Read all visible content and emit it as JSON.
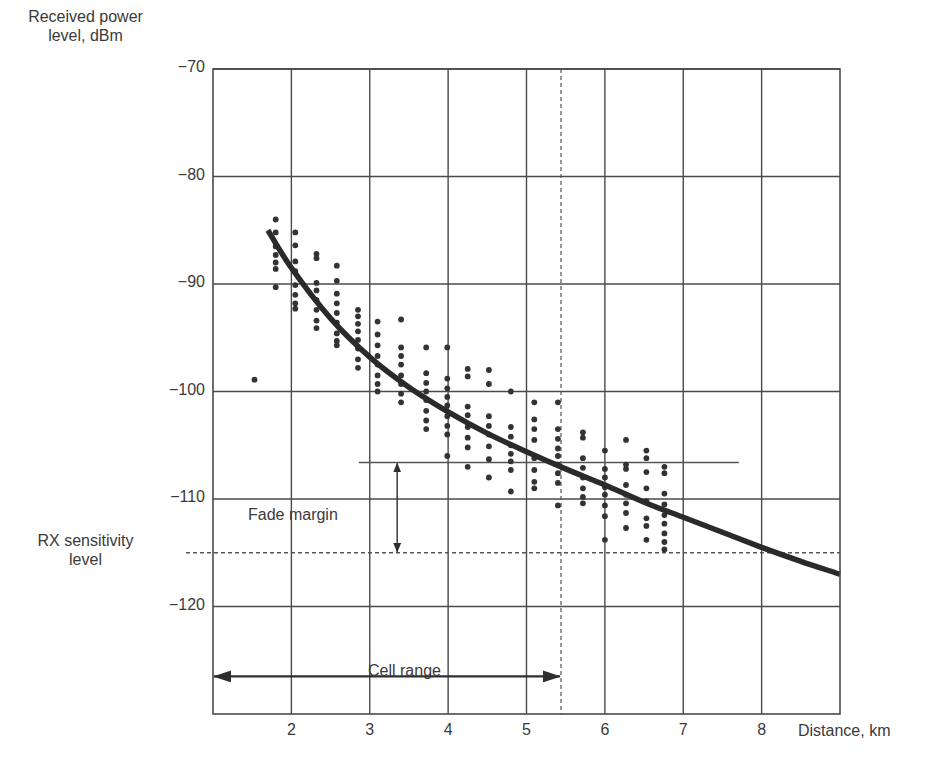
{
  "chart_data": {
    "type": "scatter",
    "title": "",
    "xlabel": "Distance, km",
    "ylabel": "Received power level, dBm",
    "xlim": [
      1,
      9
    ],
    "ylim": [
      -130,
      -70
    ],
    "grid": true,
    "x_ticks": [
      2,
      3,
      4,
      5,
      6,
      7,
      8
    ],
    "y_ticks": [
      -70,
      -80,
      -90,
      -100,
      -110,
      -120
    ],
    "y_tick_labels": [
      "−70",
      "−80",
      "−90",
      "−100",
      "−110",
      "−120"
    ],
    "x_tick_labels": [
      "2",
      "3",
      "4",
      "5",
      "6",
      "7",
      "8"
    ],
    "series": [
      {
        "name": "Measured samples",
        "kind": "scatter",
        "points": [
          [
            1.53,
            -98.9
          ],
          [
            1.8,
            -84.0
          ],
          [
            1.8,
            -85.2
          ],
          [
            1.8,
            -86.5
          ],
          [
            1.8,
            -87.3
          ],
          [
            1.8,
            -88.0
          ],
          [
            1.8,
            -88.6
          ],
          [
            1.8,
            -90.3
          ],
          [
            2.05,
            -85.2
          ],
          [
            2.05,
            -86.4
          ],
          [
            2.05,
            -87.9
          ],
          [
            2.05,
            -88.8
          ],
          [
            2.05,
            -90.1
          ],
          [
            2.05,
            -91.0
          ],
          [
            2.05,
            -91.8
          ],
          [
            2.05,
            -92.3
          ],
          [
            2.32,
            -87.2
          ],
          [
            2.32,
            -87.6
          ],
          [
            2.32,
            -89.9
          ],
          [
            2.32,
            -90.6
          ],
          [
            2.32,
            -91.5
          ],
          [
            2.32,
            -92.4
          ],
          [
            2.32,
            -93.4
          ],
          [
            2.32,
            -94.1
          ],
          [
            2.58,
            -88.3
          ],
          [
            2.58,
            -89.7
          ],
          [
            2.58,
            -90.9
          ],
          [
            2.58,
            -91.8
          ],
          [
            2.58,
            -92.7
          ],
          [
            2.58,
            -93.6
          ],
          [
            2.58,
            -94.6
          ],
          [
            2.58,
            -95.3
          ],
          [
            2.58,
            -95.7
          ],
          [
            2.85,
            -92.4
          ],
          [
            2.85,
            -93.0
          ],
          [
            2.85,
            -93.7
          ],
          [
            2.85,
            -94.4
          ],
          [
            2.85,
            -95.2
          ],
          [
            2.85,
            -96.0
          ],
          [
            2.85,
            -97.0
          ],
          [
            2.85,
            -97.8
          ],
          [
            3.1,
            -93.5
          ],
          [
            3.1,
            -94.7
          ],
          [
            3.1,
            -95.7
          ],
          [
            3.1,
            -96.7
          ],
          [
            3.1,
            -97.5
          ],
          [
            3.1,
            -98.5
          ],
          [
            3.1,
            -99.3
          ],
          [
            3.1,
            -100.0
          ],
          [
            3.4,
            -93.3
          ],
          [
            3.4,
            -95.9
          ],
          [
            3.4,
            -96.7
          ],
          [
            3.4,
            -97.5
          ],
          [
            3.4,
            -98.5
          ],
          [
            3.4,
            -99.3
          ],
          [
            3.4,
            -100.2
          ],
          [
            3.4,
            -101.0
          ],
          [
            3.72,
            -95.9
          ],
          [
            3.72,
            -98.3
          ],
          [
            3.72,
            -99.2
          ],
          [
            3.72,
            -100.0
          ],
          [
            3.72,
            -100.8
          ],
          [
            3.72,
            -101.8
          ],
          [
            3.72,
            -102.7
          ],
          [
            3.72,
            -103.5
          ],
          [
            3.99,
            -95.9
          ],
          [
            3.99,
            -98.8
          ],
          [
            3.99,
            -99.7
          ],
          [
            3.99,
            -100.5
          ],
          [
            3.99,
            -101.3
          ],
          [
            3.99,
            -102.3
          ],
          [
            3.99,
            -103.2
          ],
          [
            3.99,
            -104.0
          ],
          [
            3.99,
            -106.0
          ],
          [
            4.25,
            -97.9
          ],
          [
            4.25,
            -98.6
          ],
          [
            4.25,
            -101.4
          ],
          [
            4.25,
            -102.2
          ],
          [
            4.25,
            -103.3
          ],
          [
            4.25,
            -104.3
          ],
          [
            4.25,
            -105.2
          ],
          [
            4.25,
            -107.0
          ],
          [
            4.52,
            -98.0
          ],
          [
            4.52,
            -99.3
          ],
          [
            4.52,
            -102.3
          ],
          [
            4.52,
            -103.2
          ],
          [
            4.52,
            -104.0
          ],
          [
            4.52,
            -105.1
          ],
          [
            4.52,
            -106.3
          ],
          [
            4.52,
            -108.0
          ],
          [
            4.8,
            -100.0
          ],
          [
            4.8,
            -103.3
          ],
          [
            4.8,
            -104.2
          ],
          [
            4.8,
            -105.0
          ],
          [
            4.8,
            -105.8
          ],
          [
            4.8,
            -106.5
          ],
          [
            4.8,
            -107.3
          ],
          [
            4.8,
            -109.3
          ],
          [
            5.1,
            -101.0
          ],
          [
            5.1,
            -102.6
          ],
          [
            5.1,
            -103.5
          ],
          [
            5.1,
            -104.5
          ],
          [
            5.1,
            -106.2
          ],
          [
            5.1,
            -107.3
          ],
          [
            5.1,
            -108.4
          ],
          [
            5.1,
            -109.0
          ],
          [
            5.4,
            -101.0
          ],
          [
            5.4,
            -103.5
          ],
          [
            5.4,
            -104.4
          ],
          [
            5.4,
            -105.3
          ],
          [
            5.4,
            -106.0
          ],
          [
            5.4,
            -106.8
          ],
          [
            5.4,
            -107.6
          ],
          [
            5.4,
            -108.5
          ],
          [
            5.4,
            -110.6
          ],
          [
            5.72,
            -103.8
          ],
          [
            5.72,
            -104.3
          ],
          [
            5.72,
            -106.2
          ],
          [
            5.72,
            -107.1
          ],
          [
            5.72,
            -108.0
          ],
          [
            5.72,
            -109.0
          ],
          [
            5.72,
            -109.8
          ],
          [
            5.72,
            -110.4
          ],
          [
            6.0,
            -105.5
          ],
          [
            6.0,
            -107.2
          ],
          [
            6.0,
            -108.0
          ],
          [
            6.0,
            -108.9
          ],
          [
            6.0,
            -109.6
          ],
          [
            6.0,
            -110.6
          ],
          [
            6.0,
            -111.6
          ],
          [
            6.0,
            -113.8
          ],
          [
            6.27,
            -104.5
          ],
          [
            6.27,
            -106.8
          ],
          [
            6.27,
            -107.2
          ],
          [
            6.27,
            -108.7
          ],
          [
            6.27,
            -109.6
          ],
          [
            6.27,
            -110.4
          ],
          [
            6.27,
            -111.3
          ],
          [
            6.27,
            -112.7
          ],
          [
            6.53,
            -105.5
          ],
          [
            6.53,
            -106.2
          ],
          [
            6.53,
            -107.5
          ],
          [
            6.53,
            -109.0
          ],
          [
            6.53,
            -110.2
          ],
          [
            6.53,
            -111.8
          ],
          [
            6.53,
            -112.5
          ],
          [
            6.53,
            -113.8
          ],
          [
            6.76,
            -107.0
          ],
          [
            6.76,
            -107.6
          ],
          [
            6.76,
            -109.5
          ],
          [
            6.76,
            -110.5
          ],
          [
            6.76,
            -111.5
          ],
          [
            6.76,
            -112.3
          ],
          [
            6.76,
            -113.2
          ],
          [
            6.76,
            -114.0
          ],
          [
            6.76,
            -114.7
          ]
        ]
      },
      {
        "name": "Path loss model",
        "kind": "line",
        "points": [
          [
            1.7,
            -85.0
          ],
          [
            2.0,
            -88.5
          ],
          [
            2.5,
            -93.2
          ],
          [
            3.0,
            -96.8
          ],
          [
            3.5,
            -99.6
          ],
          [
            4.0,
            -101.9
          ],
          [
            4.5,
            -103.9
          ],
          [
            5.0,
            -105.6
          ],
          [
            5.5,
            -107.2
          ],
          [
            6.0,
            -108.7
          ],
          [
            6.5,
            -110.3
          ],
          [
            7.0,
            -111.7
          ],
          [
            7.5,
            -113.1
          ],
          [
            8.0,
            -114.5
          ],
          [
            8.5,
            -115.8
          ],
          [
            9.0,
            -117.0
          ]
        ]
      }
    ],
    "annotations": {
      "rx_sensitivity": {
        "label_line1": "RX sensitivity",
        "label_line2": "level",
        "value_dbm": -115.0
      },
      "fade_margin": {
        "label": "Fade margin",
        "top_dbm": -106.6,
        "bottom_dbm": -115.0,
        "line_x_start_km": 2.86,
        "line_x_end_km": 7.71,
        "arrow_x_km": 3.35
      },
      "cell_range": {
        "label": "Cell range",
        "start_km": 1.0,
        "end_km": 5.44,
        "y_dbm": -126.5
      },
      "cell_edge_dashed_km": 5.44
    }
  },
  "labels": {
    "ylabel_line1": "Received power",
    "ylabel_line2": "level, dBm",
    "xlabel": "Distance, km",
    "rx_line1": "RX sensitivity",
    "rx_line2": "level",
    "fade_margin": "Fade margin",
    "cell_range": "Cell range"
  },
  "colors": {
    "grid": "#4a4a4a",
    "points": "#333333",
    "curve": "#2a2a2a",
    "text": "#3a3a3a",
    "background": "#ffffff"
  }
}
